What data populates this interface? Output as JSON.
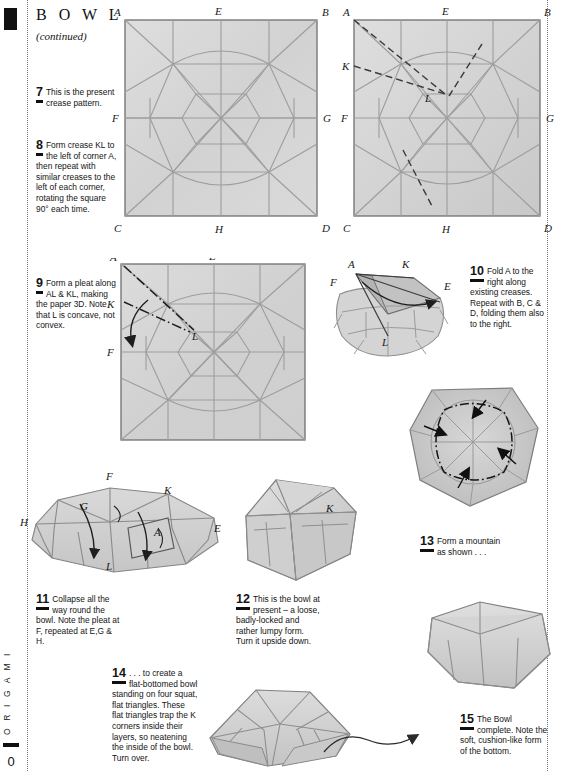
{
  "book": {
    "series_label": "O R I G A M I",
    "folio": "0"
  },
  "header": {
    "title": "B O W L",
    "subtitle": "(continued)"
  },
  "steps": [
    {
      "number": "7",
      "text": "This is the present crease pattern."
    },
    {
      "number": "8",
      "text": "Form crease KL to the left of corner A, then repeat with similar creases to the left of each corner, rotating the square 90° each time."
    },
    {
      "number": "9",
      "text": "Form a pleat along AL & KL, making the paper 3D. Note that L is concave, not convex."
    },
    {
      "number": "10",
      "text": "Fold A to the right along existing creases. Repeat with B, C & D, folding them also to the right."
    },
    {
      "number": "11",
      "text": "Collapse all the way round the bowl. Note the pleat at F, repeated at E,G & H."
    },
    {
      "number": "12",
      "text": "This is the bowl at present – a loose, badly-locked and rather lumpy form. Turn it upside down."
    },
    {
      "number": "13",
      "text": "Form a mountain as shown . . ."
    },
    {
      "number": "14",
      "text": ". . . to create a flat-bottomed bowl standing on four squat, flat triangles. These flat triangles trap the K corners inside their layers, so neatening the inside of the bowl. Turn over."
    },
    {
      "number": "15",
      "text": "The Bowl complete. Note the soft, cushion-like form of the bottom."
    }
  ],
  "figures": {
    "fig7": {
      "name": "crease-pattern-square",
      "corner_labels": [
        "A",
        "E",
        "B",
        "F",
        "G",
        "C",
        "H",
        "D"
      ]
    },
    "fig8": {
      "name": "crease-pattern-with-kl",
      "corner_labels": [
        "A",
        "E",
        "B",
        "K",
        "L",
        "F",
        "G",
        "C",
        "H",
        "D"
      ]
    },
    "fig9": {
      "name": "pleat-square",
      "corner_labels": [
        "A",
        "E",
        "K",
        "L",
        "F"
      ]
    },
    "fig10": {
      "name": "folded-corner-3d",
      "corner_labels": [
        "A",
        "K",
        "F",
        "E",
        "L"
      ]
    },
    "fig11": {
      "name": "collapse-bowl-3d",
      "corner_labels": [
        "H",
        "G",
        "F",
        "K",
        "A",
        "E",
        "L"
      ]
    },
    "fig12": {
      "name": "lumpy-bowl-3d",
      "corner_labels": [
        "K"
      ]
    },
    "fig13": {
      "name": "bowl-underside-mountain",
      "corner_labels": []
    },
    "fig14": {
      "name": "flat-bottomed-bowl",
      "corner_labels": []
    },
    "fig15": {
      "name": "bowl-complete",
      "corner_labels": []
    }
  },
  "colors": {
    "paper_fill": "#d6d6d6",
    "paper_fill_light": "#e2e2e2",
    "crease_line": "#9a9a9a",
    "edge_line": "#6f6f6f",
    "ink": "#111111"
  }
}
